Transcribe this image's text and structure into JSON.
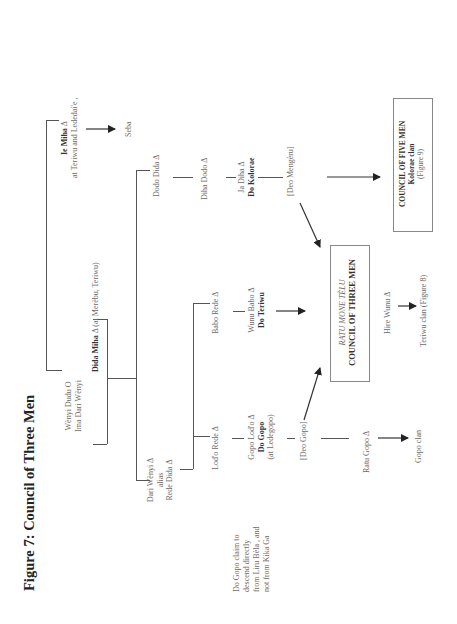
{
  "figure": {
    "title": "Figure 7: Council of Three Men"
  },
  "nodes": {
    "wenyi_dudu": {
      "line1": "Wènyi  Dudu  O",
      "line2": "Ima Dari Wènyi"
    },
    "dida_miha": {
      "name": "Dida  Miha",
      "note": " Δ (at Merèbu, Teriwu)"
    },
    "ie_miha": {
      "name": "Ie  Miha",
      "mark": "  Δ",
      "note": "at Teriwu and Lededai'e ,"
    },
    "seba": "Seba",
    "dodo_dida": "Dodo Dida  Δ",
    "diha_dodo": "Diha  Dodo  Δ",
    "ja_diha": {
      "line1": "Ja  Diha  Δ",
      "line2": "Do  Kolorae"
    },
    "deo_mengeru": "[Deo  Mengèru]",
    "dari_wenyi": {
      "line1": "Dari  Wènyi  Δ",
      "line2": "alias",
      "line3": "Rede  Dida Δ"
    },
    "babo_rede": "Babo  Rede  Δ",
    "wunu_babo": {
      "line1": "Wunu  Babo  Δ",
      "line2": "Do  Teriwu"
    },
    "lodo_rede": "Lod'o  Rede  Δ",
    "gopo_lodo": {
      "line1": "Gopo  Lod'o  Δ",
      "line2": "Do  Gopo",
      "line3": "(at Ledegopo)"
    },
    "deo_gopo": "[Deo  Gopo]",
    "ratu_gopo": "Ratu   Gopo  Δ",
    "gopo_clan": "Gopo clan",
    "hire_wunu": "Hire   Wunu   Δ",
    "teriwu_clan": "Teriwu clan (Figure 8)",
    "do_gopo_claim": {
      "line1": "Do Gopo claim to",
      "line2": "descend directly",
      "line3": "from Liru Bèla , and",
      "line4": "not from Kika Ga"
    }
  },
  "boxes": {
    "council_three": {
      "line1": "RATU  MONE  TÈLU",
      "line2": "COUNCIL   OF   THREE   MEN"
    },
    "council_five": {
      "line1": "COUNCIL OF FIVE MEN",
      "line2": "Kolorae clan",
      "line3": "(Figure 9)"
    }
  },
  "symbols": {
    "male": "Δ",
    "female": "O"
  }
}
